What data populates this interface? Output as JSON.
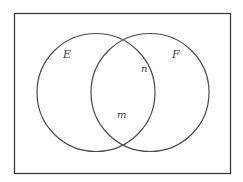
{
  "diagram": {
    "type": "venn",
    "universe": {
      "x": 14,
      "y": 13,
      "width": 216,
      "height": 160,
      "stroke": "#3a3a3a"
    },
    "sets": [
      {
        "name": "E",
        "cx": 96,
        "cy": 92.5,
        "r": 59,
        "label": "E",
        "label_x": 67,
        "label_y": 58
      },
      {
        "name": "F",
        "cx": 150,
        "cy": 92.5,
        "r": 59,
        "label": "F",
        "label_x": 176,
        "label_y": 58
      }
    ],
    "points": [
      {
        "label": "n",
        "x": 142,
        "y": 71
      },
      {
        "label": "m",
        "x": 119,
        "y": 117
      }
    ],
    "stroke_color": "#4a4a4a"
  }
}
